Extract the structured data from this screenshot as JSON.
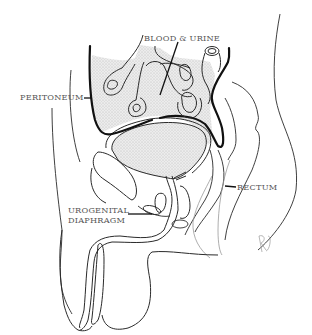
{
  "diagram": {
    "type": "anatomical-line-drawing",
    "labels": {
      "blood_urine": "BLOOD & URINE",
      "peritoneum": "PERITONEUM",
      "rectum": "RECTUM",
      "urogenital_line1": "UROGENITAL",
      "urogenital_line2": "DIAPHRAGM"
    },
    "signature": "RJ",
    "colors": {
      "background": "#ffffff",
      "line": "#2a2a2a",
      "label_text": "#555555",
      "shading": "#d9d9d9",
      "peritoneum_line": "#111111"
    }
  }
}
